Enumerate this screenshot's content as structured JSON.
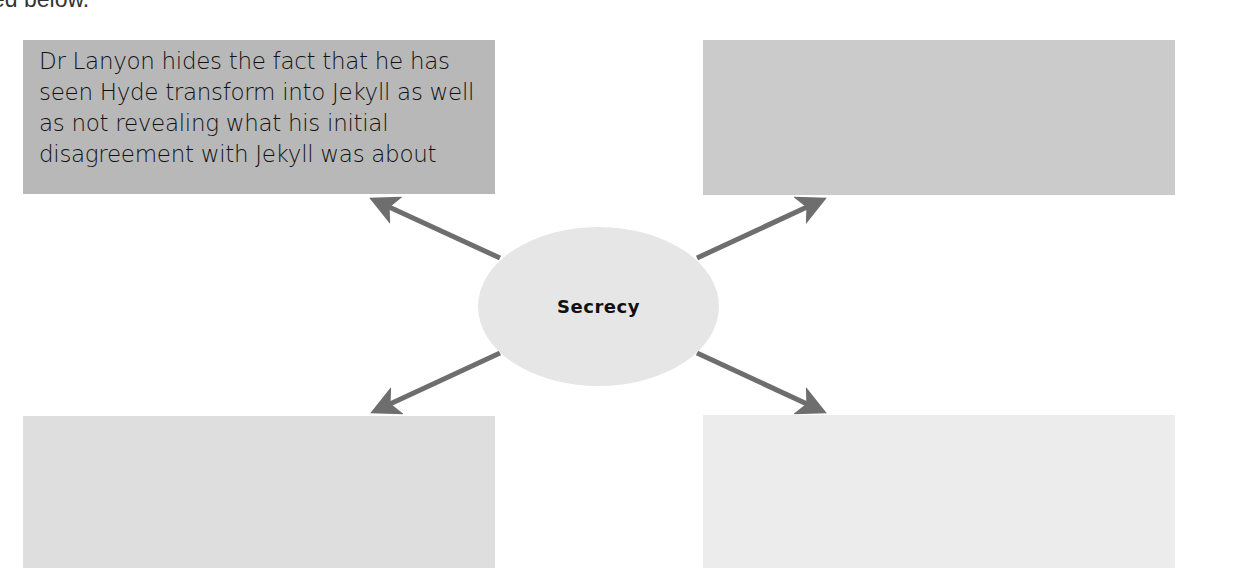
{
  "intro": {
    "text": "ed below."
  },
  "diagram": {
    "center": {
      "label": "Secrecy",
      "color": "#e6e6e6"
    },
    "arrow_color": "#6e6e6e",
    "boxes": [
      {
        "id": "top-left",
        "text": "Dr Lanyon hides the fact that he has seen Hyde transform into Jekyll as well as not revealing what his initial disagreement with Jekyll was about",
        "color": "#b8b8b8"
      },
      {
        "id": "top-right",
        "text": "",
        "color": "#cbcbcb"
      },
      {
        "id": "bottom-left",
        "text": "",
        "color": "#dedede"
      },
      {
        "id": "bottom-right",
        "text": "",
        "color": "#ececec"
      }
    ]
  }
}
